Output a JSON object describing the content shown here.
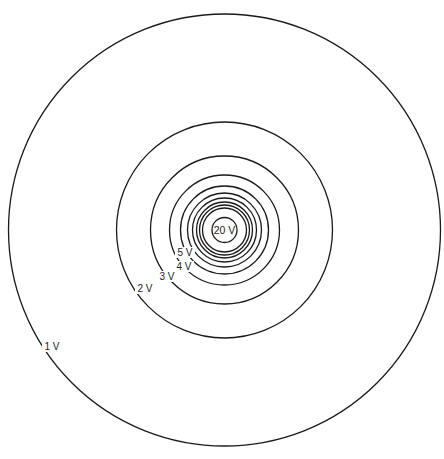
{
  "diagram": {
    "center": {
      "x": 224.5,
      "y": 230
    },
    "line_color": "#1a1a1a",
    "equipotentials": [
      {
        "potential": 1,
        "label": "1 V",
        "radius": 216,
        "labeled": true,
        "label_pos": {
          "x": 52,
          "y": 350
        }
      },
      {
        "potential": 2,
        "label": "2 V",
        "radius": 108,
        "labeled": true,
        "label_pos": {
          "x": 145,
          "y": 292
        }
      },
      {
        "potential": 3,
        "label": "3 V",
        "radius": 74,
        "labeled": true,
        "label_pos": {
          "x": 167,
          "y": 280
        }
      },
      {
        "potential": 4,
        "label": "4 V",
        "radius": 55,
        "labeled": true,
        "label_pos": {
          "x": 184,
          "y": 270
        }
      },
      {
        "potential": 5,
        "label": "5 V",
        "radius": 44,
        "labeled": true,
        "label_pos": {
          "x": 185,
          "y": 256
        }
      },
      {
        "potential": 6,
        "label": "",
        "radius": 37,
        "labeled": false
      },
      {
        "potential": 7,
        "label": "",
        "radius": 32,
        "labeled": false
      },
      {
        "potential": 8,
        "label": "",
        "radius": 28,
        "labeled": false
      },
      {
        "potential": 9,
        "label": "",
        "radius": 25,
        "labeled": false
      },
      {
        "potential": 10,
        "label": "",
        "radius": 22,
        "labeled": false
      },
      {
        "potential": 20,
        "label": "20 V",
        "radius": 12.5,
        "labeled": true,
        "label_pos": {
          "x": 224.5,
          "y": 234
        }
      }
    ]
  }
}
